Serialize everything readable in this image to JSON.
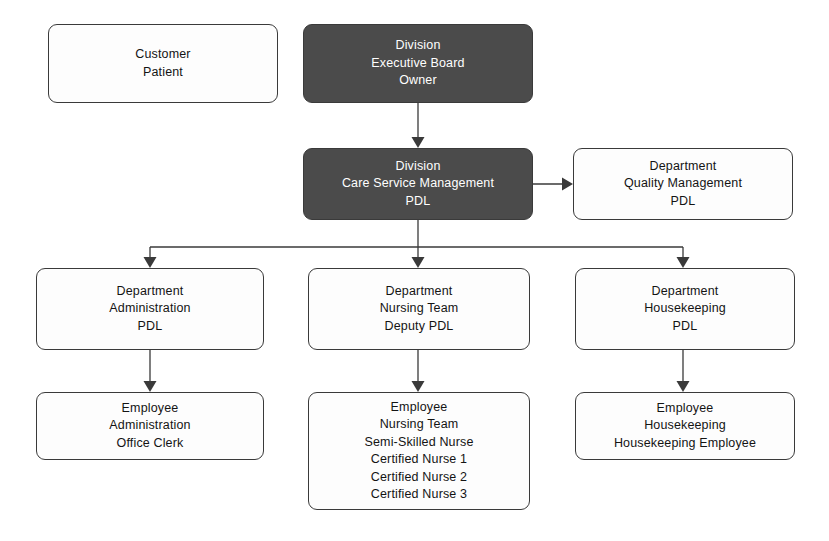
{
  "diagram": {
    "type": "org-chart",
    "canvas": {
      "width": 829,
      "height": 541
    },
    "colors": {
      "highlight_fill": "#4b4b4b",
      "highlight_text": "#ffffff",
      "node_fill": "#fdfdfd",
      "node_text": "#141414",
      "stroke": "#3a3a3a",
      "background": "#ffffff"
    }
  },
  "nodes": [
    {
      "id": "customer-patient",
      "name": "customer-patient",
      "style": "light",
      "x": 48,
      "y": 24,
      "w": 230,
      "h": 79,
      "lines": [
        "Customer",
        "Patient"
      ]
    },
    {
      "id": "division-executive-board",
      "name": "division-executive-board",
      "style": "dark",
      "x": 303,
      "y": 24,
      "w": 230,
      "h": 79,
      "lines": [
        "Division",
        "Executive Board",
        "Owner"
      ]
    },
    {
      "id": "division-care-service-management",
      "name": "division-care-service-management",
      "style": "dark",
      "x": 303,
      "y": 148,
      "w": 230,
      "h": 72,
      "lines": [
        "Division",
        "Care Service Management",
        "PDL"
      ]
    },
    {
      "id": "department-quality-management",
      "name": "department-quality-management",
      "style": "light",
      "x": 573,
      "y": 148,
      "w": 220,
      "h": 72,
      "lines": [
        "Department",
        "Quality Management",
        "PDL"
      ]
    },
    {
      "id": "department-administration",
      "name": "department-administration",
      "style": "light",
      "x": 36,
      "y": 268,
      "w": 228,
      "h": 82,
      "lines": [
        "Department",
        "Administration",
        "PDL"
      ]
    },
    {
      "id": "department-nursing-team",
      "name": "department-nursing-team",
      "style": "light",
      "x": 308,
      "y": 268,
      "w": 222,
      "h": 82,
      "lines": [
        "Department",
        "Nursing Team",
        "Deputy PDL"
      ]
    },
    {
      "id": "department-housekeeping",
      "name": "department-housekeeping",
      "style": "light",
      "x": 575,
      "y": 268,
      "w": 220,
      "h": 82,
      "lines": [
        "Department",
        "Housekeeping",
        "PDL"
      ]
    },
    {
      "id": "employee-administration",
      "name": "employee-administration",
      "style": "light",
      "x": 36,
      "y": 392,
      "w": 228,
      "h": 68,
      "lines": [
        "Employee",
        "Administration",
        "Office Clerk"
      ]
    },
    {
      "id": "employee-nursing-team",
      "name": "employee-nursing-team",
      "style": "light",
      "x": 308,
      "y": 392,
      "w": 222,
      "h": 118,
      "lines": [
        "Employee",
        "Nursing Team",
        "Semi-Skilled Nurse",
        "Certified Nurse 1",
        "Certified Nurse 2",
        "Certified Nurse 3"
      ]
    },
    {
      "id": "employee-housekeeping",
      "name": "employee-housekeeping",
      "style": "light",
      "x": 575,
      "y": 392,
      "w": 220,
      "h": 68,
      "lines": [
        "Employee",
        "Housekeeping",
        "Housekeeping Employee"
      ]
    }
  ],
  "edges": [
    {
      "id": "edge-executive-to-care-service",
      "name": "edge-executive-board-to-care-service-management",
      "from": "division-executive-board",
      "to": "division-care-service-management",
      "path": "M 418 103 L 418 141",
      "arrow": "down",
      "arrow_at": {
        "x": 418,
        "y": 148
      }
    },
    {
      "id": "edge-care-service-to-quality",
      "name": "edge-care-service-management-to-quality-management",
      "from": "division-care-service-management",
      "to": "department-quality-management",
      "path": "M 533 184 L 566 184",
      "arrow": "right",
      "arrow_at": {
        "x": 573,
        "y": 184
      }
    },
    {
      "id": "edge-care-service-bus-drop",
      "name": "edge-care-service-management-bus-drop",
      "from": "division-care-service-management",
      "to": "bus",
      "path": "M 418 220 L 418 247",
      "arrow": "none"
    },
    {
      "id": "edge-bus",
      "name": "edge-horizontal-bus",
      "from": "bus",
      "to": "bus",
      "path": "M 150 247 L 683 247",
      "arrow": "none"
    },
    {
      "id": "edge-bus-to-administration",
      "name": "edge-bus-to-department-administration",
      "from": "bus",
      "to": "department-administration",
      "path": "M 150 247 L 150 261",
      "arrow": "down",
      "arrow_at": {
        "x": 150,
        "y": 268
      }
    },
    {
      "id": "edge-bus-to-nursing",
      "name": "edge-bus-to-department-nursing-team",
      "from": "bus",
      "to": "department-nursing-team",
      "path": "M 418 247 L 418 261",
      "arrow": "down",
      "arrow_at": {
        "x": 418,
        "y": 268
      }
    },
    {
      "id": "edge-bus-to-housekeeping",
      "name": "edge-bus-to-department-housekeeping",
      "from": "bus",
      "to": "department-housekeeping",
      "path": "M 683 247 L 683 261",
      "arrow": "down",
      "arrow_at": {
        "x": 683,
        "y": 268
      }
    },
    {
      "id": "edge-administration-to-employee",
      "name": "edge-department-administration-to-employee-administration",
      "from": "department-administration",
      "to": "employee-administration",
      "path": "M 150 350 L 150 385",
      "arrow": "down",
      "arrow_at": {
        "x": 150,
        "y": 392
      }
    },
    {
      "id": "edge-nursing-to-employee",
      "name": "edge-department-nursing-team-to-employee-nursing-team",
      "from": "department-nursing-team",
      "to": "employee-nursing-team",
      "path": "M 418 350 L 418 385",
      "arrow": "down",
      "arrow_at": {
        "x": 418,
        "y": 392
      }
    },
    {
      "id": "edge-housekeeping-to-employee",
      "name": "edge-department-housekeeping-to-employee-housekeeping",
      "from": "department-housekeeping",
      "to": "employee-housekeeping",
      "path": "M 683 350 L 683 385",
      "arrow": "down",
      "arrow_at": {
        "x": 683,
        "y": 392
      }
    }
  ]
}
